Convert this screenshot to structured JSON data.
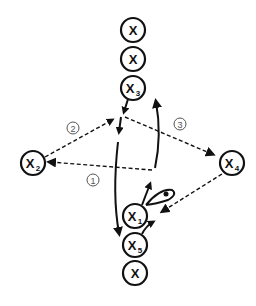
{
  "diagram": {
    "type": "play-diagram",
    "nodes": [
      {
        "id": "x-top",
        "label": "X",
        "sub": "",
        "cx": 133,
        "cy": 30
      },
      {
        "id": "x-second",
        "label": "X",
        "sub": "",
        "cx": 133,
        "cy": 59
      },
      {
        "id": "x3",
        "label": "X",
        "sub": "3",
        "cx": 133,
        "cy": 88
      },
      {
        "id": "x2",
        "label": "X",
        "sub": "2",
        "cx": 33,
        "cy": 163
      },
      {
        "id": "x4",
        "label": "X",
        "sub": "4",
        "cx": 232,
        "cy": 163
      },
      {
        "id": "x1",
        "label": "X",
        "sub": "1",
        "cx": 135,
        "cy": 216
      },
      {
        "id": "x5",
        "label": "X",
        "sub": "5",
        "cx": 135,
        "cy": 245
      },
      {
        "id": "x-bottom",
        "label": "X",
        "sub": "",
        "cx": 135,
        "cy": 273
      }
    ],
    "step_labels": [
      {
        "id": "step-1",
        "text": "①",
        "value": "1",
        "x": 93,
        "y": 180
      },
      {
        "id": "step-2",
        "text": "②",
        "value": "2",
        "x": 73,
        "y": 128
      },
      {
        "id": "step-3",
        "text": "③",
        "value": "3",
        "x": 180,
        "y": 124
      }
    ],
    "edges": [
      {
        "id": "x3-short-move",
        "style": "solid",
        "desc": "short arrow from X3 down"
      },
      {
        "id": "cut-down-to-x5",
        "style": "solid",
        "desc": "long curved cut down to X5 area"
      },
      {
        "id": "x1-up-curve",
        "style": "solid",
        "desc": "curved move upward"
      },
      {
        "id": "pass-2",
        "style": "dashed",
        "desc": "pass between X2 and top post"
      },
      {
        "id": "pass-1",
        "style": "dashed",
        "desc": "pass to X2"
      },
      {
        "id": "pass-3",
        "style": "dashed",
        "desc": "pass to X4"
      },
      {
        "id": "pass-x4-x1",
        "style": "dashed",
        "desc": "pass from X4 to X1"
      },
      {
        "id": "x5-to-x1",
        "style": "solid",
        "desc": "move from X5 up"
      },
      {
        "id": "ball-handler",
        "style": "solid",
        "desc": "ball indicator loop at X1"
      }
    ]
  }
}
